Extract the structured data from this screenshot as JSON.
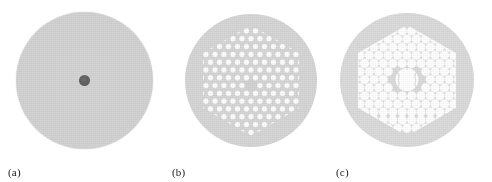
{
  "figure": {
    "kind": "micrograph-triptych",
    "background_color": "#ffffff",
    "panels": [
      {
        "label": "(a)",
        "name": "step-index-fiber",
        "disk": {
          "center_x": 84,
          "center_y": 80,
          "radius": 68,
          "fill_color": "#d3d3d3",
          "edge_color": "#cbcbcb"
        },
        "core": {
          "shape": "circle",
          "center_x": 85,
          "center_y": 90,
          "diameter": 11,
          "color": "#636363"
        },
        "holes": []
      },
      {
        "label": "(b)",
        "name": "solid-core-photonic-crystal-fiber",
        "disk": {
          "center_x": 250,
          "center_y": 82,
          "radius": 66,
          "fill_color": "#d6d6d6",
          "edge_color": "#cdcdcd"
        },
        "lattice": {
          "type": "triangular",
          "pitch": 9.0,
          "hole_diameter": 5.4,
          "hole_color": "#fdfdfd",
          "rings": 6,
          "boundary": "hexagon",
          "core_defect": "missing-hole-solid-core"
        }
      },
      {
        "label": "(c)",
        "name": "hollow-core-photonic-bandgap-fiber",
        "disk": {
          "center_x": 418,
          "center_y": 81,
          "radius": 67,
          "fill_color": "#dbdbdb",
          "edge_color": "#d0d0d0"
        },
        "lattice": {
          "type": "triangular",
          "pitch": 9.4,
          "hole_diameter": 8.8,
          "hole_color": "#ffffff",
          "strut_color": "#dcdcdc",
          "rings": 6,
          "boundary": "hexagon",
          "core_defect": "seven-cell-hollow-core",
          "core_diameter": 22
        }
      }
    ]
  },
  "colors": {
    "page_background": "#ffffff",
    "glass_light": "#d4d4d4",
    "glass_mid": "#d8d8d8",
    "air_hole": "#ffffff",
    "dark_core": "#636363",
    "label_text": "#1b1b1b"
  }
}
